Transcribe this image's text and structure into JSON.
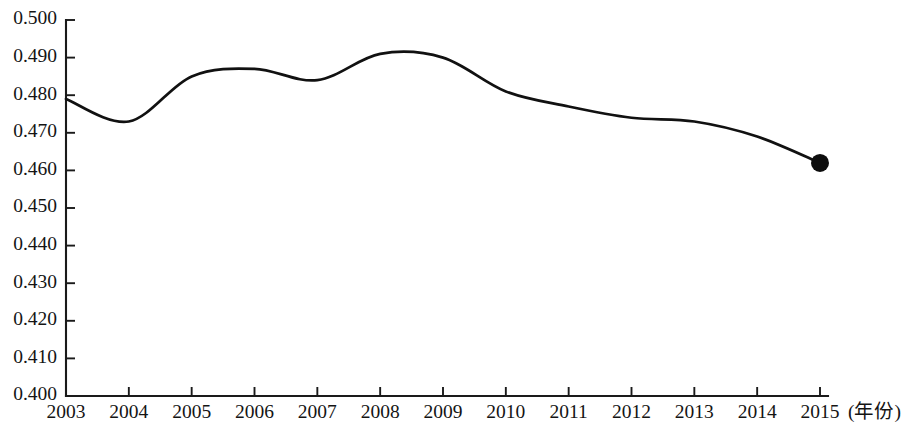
{
  "chart_data": {
    "type": "line",
    "title": "",
    "subtitle": "",
    "xlabel": "(年份)",
    "ylabel": "",
    "x": [
      2003,
      2004,
      2005,
      2006,
      2007,
      2008,
      2009,
      2010,
      2011,
      2012,
      2013,
      2014,
      2015
    ],
    "categories": [
      "2003",
      "2004",
      "2005",
      "2006",
      "2007",
      "2008",
      "2009",
      "2010",
      "2011",
      "2012",
      "2013",
      "2014",
      "2015"
    ],
    "values": [
      0.479,
      0.473,
      0.485,
      0.487,
      0.484,
      0.491,
      0.49,
      0.481,
      0.477,
      0.474,
      0.473,
      0.469,
      0.462
    ],
    "series": [
      {
        "name": "",
        "values": [
          0.479,
          0.473,
          0.485,
          0.487,
          0.484,
          0.491,
          0.49,
          0.481,
          0.477,
          0.474,
          0.473,
          0.469,
          0.462
        ]
      }
    ],
    "xlim": [
      2003,
      2015
    ],
    "ylim": [
      0.4,
      0.5
    ],
    "ytick_labels": [
      "0.500",
      "0.490",
      "0.480",
      "0.470",
      "0.460",
      "0.450",
      "0.440",
      "0.430",
      "0.420",
      "0.410",
      "0.400"
    ],
    "ytick_values": [
      0.5,
      0.49,
      0.48,
      0.47,
      0.46,
      0.45,
      0.44,
      0.43,
      0.42,
      0.41,
      0.4
    ],
    "xtick_labels": [
      "2003",
      "2004",
      "2005",
      "2006",
      "2007",
      "2008",
      "2009",
      "2010",
      "2011",
      "2012",
      "2013",
      "2014",
      "2015"
    ],
    "grid": false,
    "legend": null,
    "legend_position": "none",
    "markers": [
      {
        "x": 2015,
        "y": 0.462,
        "label": ""
      }
    ],
    "annotations": [],
    "line_color": "#111111",
    "marker_color": "#0d0d0d",
    "axis_color": "#1a1a1a",
    "background_color": "#ffffff"
  }
}
